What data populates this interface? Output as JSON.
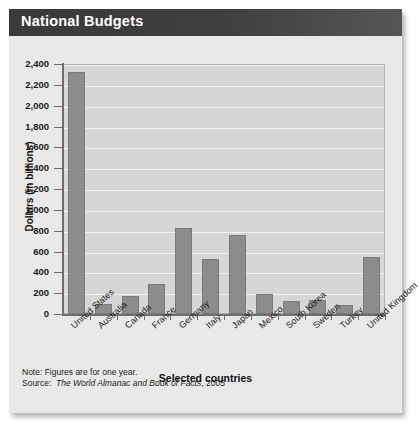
{
  "title": "National Budgets",
  "footnote": {
    "note": "Note: Figures are for one year.",
    "source_label": "Source:",
    "source_title": "The World Almanac and Book of Facts",
    "source_year": ", 2005"
  },
  "colors": {
    "bar": "#8c8c8c",
    "plot_background": "#d6d6d6",
    "gridline": "#f4f4f4",
    "titlebar": "#3f3f3f",
    "figure_background": "#e9e9e9"
  },
  "chart_data": {
    "type": "bar",
    "title": "National Budgets",
    "xlabel": "Selected countries",
    "ylabel": "Dollars (in billions)",
    "ylim": [
      0,
      2400
    ],
    "ytick_step": 200,
    "grid": true,
    "legend": "none",
    "yticks": [
      "0",
      "200",
      "400",
      "600",
      "800",
      "1,000",
      "1,200",
      "1,400",
      "1,600",
      "1,800",
      "2,000",
      "2,200",
      "2,400"
    ],
    "categories": [
      "United States",
      "Australia",
      "Canada",
      "France",
      "Germany",
      "Italy",
      "Japan",
      "Mexico",
      "South Korea",
      "Sweden",
      "Turkey",
      "United Kingdom"
    ],
    "values": [
      2320,
      95,
      175,
      285,
      825,
      525,
      755,
      190,
      125,
      130,
      85,
      550
    ]
  }
}
